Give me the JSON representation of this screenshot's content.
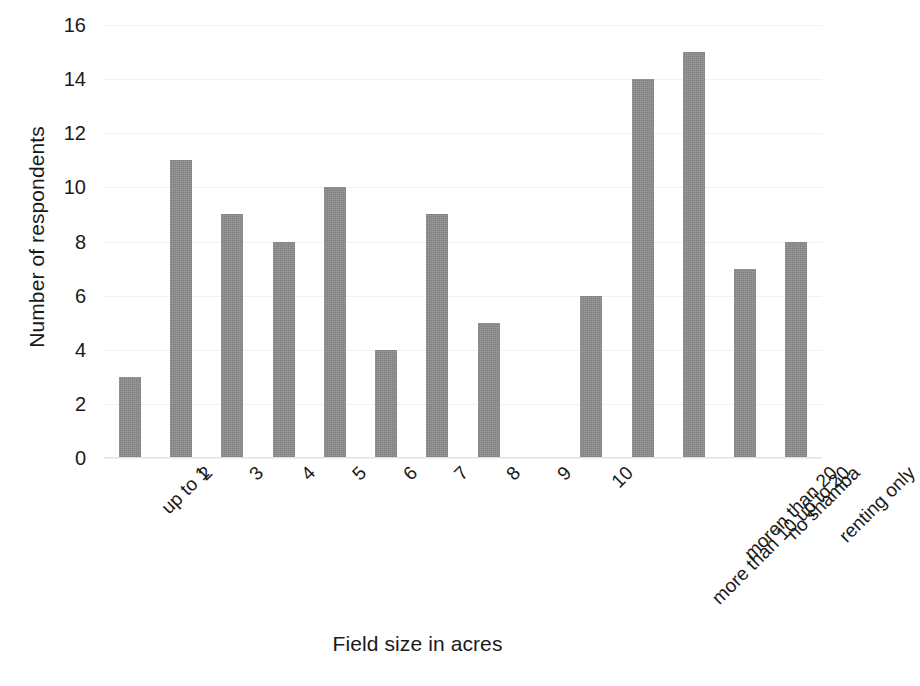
{
  "chart_data": {
    "type": "bar",
    "title": "",
    "subtitle": "",
    "xlabel": "Field size in acres",
    "ylabel": "Number of respondents",
    "categories": [
      "up to 1",
      "2",
      "3",
      "4",
      "5",
      "6",
      "7",
      "8",
      "9",
      "10",
      "more than 10 up to 20",
      "moren than 20",
      "no shamba",
      "renting only"
    ],
    "values": [
      3,
      11,
      9,
      8,
      10,
      4,
      9,
      5,
      0,
      6,
      14,
      15,
      7,
      8
    ],
    "ylim": [
      0,
      16
    ],
    "y_ticks": [
      0,
      2,
      4,
      6,
      8,
      10,
      12,
      14,
      16
    ],
    "y_tick_labels": [
      "0",
      "2",
      "4",
      "6",
      "8",
      "10",
      "12",
      "14",
      "16"
    ],
    "grid": true,
    "grid_axis": "y",
    "legend": false,
    "legend_position": "none",
    "series": [
      {
        "name": "Number of respondents",
        "values": [
          3,
          11,
          9,
          8,
          10,
          4,
          9,
          5,
          0,
          6,
          14,
          15,
          7,
          8
        ]
      }
    ],
    "annotations": [],
    "x_tick_rotation": -45
  },
  "style": {
    "bar_color": "#8c8c8c",
    "gridline_color": "#f1f1f1",
    "axis_color": "#e2e2e2",
    "background_color": "#ffffff",
    "text_color": "#1a1a1a"
  }
}
